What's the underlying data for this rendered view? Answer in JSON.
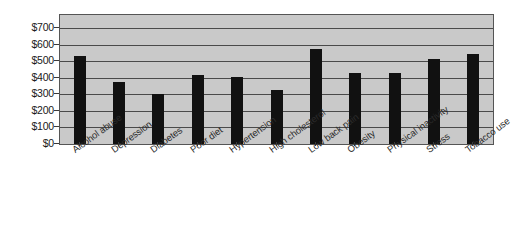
{
  "chart_data": {
    "type": "bar",
    "title": "",
    "subtitle": "",
    "xlabel": "",
    "ylabel": "",
    "categories": [
      "Alcohol abuse",
      "Depression",
      "Diabetes",
      "Poor diet",
      "Hypertension",
      "High cholesterol",
      "Low back pain",
      "Obesity",
      "Physical inactivity",
      "Stress",
      "Tobacco use"
    ],
    "values": [
      530,
      375,
      300,
      415,
      405,
      325,
      575,
      430,
      430,
      515,
      545
    ],
    "ylim": [
      0,
      780
    ],
    "y_ticks": [
      0,
      100,
      200,
      300,
      400,
      500,
      600,
      700
    ],
    "y_tick_labels": [
      "$0",
      "$100",
      "$200",
      "$300",
      "$400",
      "$500",
      "$600",
      "$700"
    ],
    "grid": true,
    "legend": false,
    "legend_position": "none",
    "bar_color": "#111111",
    "plot_background_color": "#c9c9c9",
    "gridline_color": "#4a4a4a",
    "axis_color": "#555555",
    "value_prefix": "$"
  }
}
